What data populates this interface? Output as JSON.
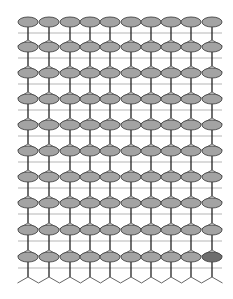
{
  "diagram": {
    "type": "lattice",
    "columns": 10,
    "rows": 10,
    "column_x": [
      28,
      49,
      70,
      90,
      110,
      131,
      151,
      171,
      191,
      212
    ],
    "row_y": [
      22,
      47,
      73,
      99,
      125,
      151,
      177,
      203,
      230,
      257
    ],
    "line_y": [
      33,
      58,
      84,
      110,
      136,
      162,
      188,
      214,
      241,
      268
    ],
    "line_x_range": [
      18,
      222
    ],
    "zigzag": {
      "peak_y": 277,
      "valley_y": 283
    },
    "ellipse": {
      "rx": 10,
      "ry": 5
    },
    "colors": {
      "ellipse_fill": "#a3a3a3",
      "ellipse_stroke": "#444444",
      "ellipse_highlight_fill": "#6e6e6e",
      "stem": "#222222",
      "hline": "#b5b5b5",
      "roof": "#555555",
      "background": "#ffffff"
    },
    "highlighted_cell": {
      "row": 9,
      "col": 9
    }
  }
}
